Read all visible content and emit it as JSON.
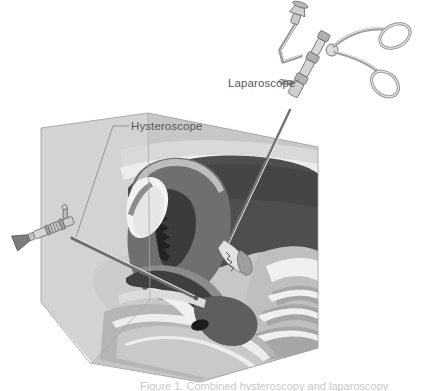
{
  "figure": {
    "background_color": "#ffffff",
    "width": 432,
    "height": 391
  },
  "labels": {
    "hysteroscope": "Hysteroscope",
    "laparoscope": "Laparoscope",
    "text_color": "#58585a",
    "leader_color": "#8a8a8c"
  },
  "caption": {
    "text": "Figure 1. Combined hysteroscopy and laparoscopy",
    "color": "#c9c9cb"
  },
  "palette": {
    "white": "#ffffff",
    "cut_plane": "#d2d2d2",
    "cut_plane_edge": "#bdbdbd",
    "skin_light": "#cfcfcf",
    "tissue_light": "#c6c6c6",
    "tissue_mid": "#ababab",
    "tissue_mid_dark": "#8f8f8f",
    "muscle_dark": "#6e6e6e",
    "cavity_dark": "#4c4c4c",
    "cavity_darkest": "#2e2e2e",
    "bladder_white": "#f2f2f2",
    "highlight": "#e8e8e8",
    "instrument_body": "#d8d8d8",
    "instrument_shade": "#a9a9a9",
    "instrument_dark": "#6a6a6a",
    "outline": "#5a5a5a"
  },
  "anatomy": {
    "regions": [
      {
        "name": "cut-plane-abdominal-wall",
        "tone": "#d2d2d2"
      },
      {
        "name": "anterior-abdominal-wall",
        "tone": "#c6c6c6"
      },
      {
        "name": "uterus-myometrium",
        "tone": "#6e6e6e"
      },
      {
        "name": "uterine-cavity",
        "tone": "#3a3a3a"
      },
      {
        "name": "urinary-bladder",
        "tone": "#f2f2f2"
      },
      {
        "name": "cervix-vagina",
        "tone": "#8f8f8f"
      },
      {
        "name": "rectum",
        "tone": "#a0a0a0"
      },
      {
        "name": "sacrum-spine",
        "tone": "#bdbdbd"
      },
      {
        "name": "pubic-bone",
        "tone": "#d8d8d8"
      },
      {
        "name": "fibroid-mass",
        "tone": "#2e2e2e"
      }
    ]
  },
  "instruments": {
    "hysteroscope": {
      "name": "hysteroscope",
      "entry": "transcervical",
      "parts": [
        "eyepiece",
        "light-post",
        "stopcock-valve",
        "barrel",
        "shaft",
        "distal-tip"
      ],
      "angle_deg": -22
    },
    "laparoscope": {
      "name": "laparoscope",
      "entry": "transabdominal",
      "parts": [
        "eyepiece-funnel",
        "light-cable-arm",
        "collar-ring",
        "trocar-sleeve",
        "stopcock",
        "shaft",
        "grasper-jaws",
        "scissor-ring-handles"
      ],
      "angle_deg": 62
    }
  }
}
